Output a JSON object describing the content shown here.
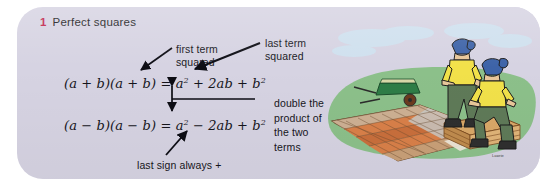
{
  "panel": {
    "background_color": "#d6d3e2",
    "page_background": "#ffffff"
  },
  "heading": {
    "number": "1",
    "number_color": "#c0224a",
    "title": "Perfect squares"
  },
  "equations": [
    {
      "id": "expand-sum",
      "left_side": "(a + b)(a + b)",
      "equals": "=",
      "right_side": "a² + 2ab + b²",
      "plain": "(a + b)(a + b) = a² + 2ab + b²"
    },
    {
      "id": "expand-difference",
      "left_side": "(a − b)(a − b)",
      "equals": "=",
      "right_side": "a² − 2ab + b²",
      "plain": "(a − b)(a − b) = a² − 2ab + b²"
    }
  ],
  "callouts": [
    {
      "id": "first-term-squared",
      "text": "first term\nsquared",
      "points_to": "a² in first equation",
      "arrow": "diagonal-down-left"
    },
    {
      "id": "last-term-squared",
      "text": "last term\nsquared",
      "points_to": "b² in first equation",
      "arrow": "diagonal-down-left"
    },
    {
      "id": "double-the-product",
      "text": "double the\nproduct of\nthe two\nterms",
      "points_to": "2ab in both equations",
      "arrow": "horizontal-line-with-vertical-double-arrow"
    },
    {
      "id": "last-sign-always-plus",
      "text": "last sign always +",
      "points_to": "+ b² in second equation",
      "arrow": "diagonal-up-right"
    }
  ],
  "illustration": {
    "name": "bricklayers-patio-illustration",
    "description": "Two workers in yellow shirts, green trousers and blue caps resting on a stack of bricks beside a part-laid brick patio, with a green wheelbarrow on the grass",
    "colors": {
      "sky": "#c9dced",
      "grass": "#8cc08a",
      "wheelbarrow": "#2e7d46",
      "shirt": "#f2e14a",
      "trousers": "#5f7a58",
      "cap": "#3d63a8",
      "brick_orange": "#d98049",
      "brick_tan": "#cdb093",
      "brick_grey": "#c9c9c4"
    },
    "signature": "Lawrie"
  }
}
